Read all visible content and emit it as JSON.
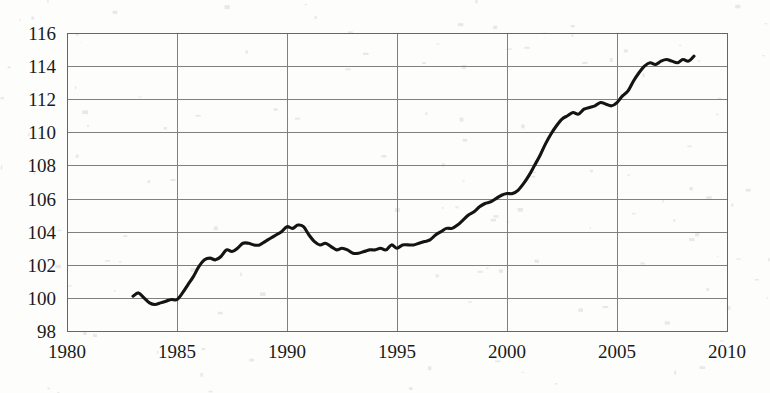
{
  "chart_data": {
    "type": "line",
    "title": "",
    "subtitle": "",
    "xlabel": "",
    "ylabel": "",
    "xlim": [
      1980,
      2010
    ],
    "ylim": [
      98,
      116
    ],
    "grid": true,
    "legend": null,
    "x_ticks": [
      "1980",
      "1985",
      "1990",
      "1995",
      "2000",
      "2005",
      "2010"
    ],
    "y_ticks": [
      "98",
      "100",
      "102",
      "104",
      "106",
      "108",
      "110",
      "112",
      "114",
      "116"
    ],
    "x_tick_values": [
      1980,
      1985,
      1990,
      1995,
      2000,
      2005,
      2010
    ],
    "y_tick_values": [
      98,
      100,
      102,
      104,
      106,
      108,
      110,
      112,
      114,
      116
    ],
    "line_color": "#141414",
    "grid_color": "#808080",
    "background_color": "#fdfdfc",
    "series": [
      {
        "name": "index",
        "x": [
          1983.0,
          1983.25,
          1983.5,
          1983.75,
          1984.0,
          1984.25,
          1984.5,
          1984.75,
          1985.0,
          1985.25,
          1985.5,
          1985.75,
          1986.0,
          1986.25,
          1986.5,
          1986.75,
          1987.0,
          1987.25,
          1987.5,
          1987.75,
          1988.0,
          1988.25,
          1988.5,
          1988.75,
          1989.0,
          1989.25,
          1989.5,
          1989.75,
          1990.0,
          1990.25,
          1990.5,
          1990.75,
          1991.0,
          1991.25,
          1991.5,
          1991.75,
          1992.0,
          1992.25,
          1992.5,
          1992.75,
          1993.0,
          1993.25,
          1993.5,
          1993.75,
          1994.0,
          1994.25,
          1994.5,
          1994.75,
          1995.0,
          1995.25,
          1995.5,
          1995.75,
          1996.0,
          1996.25,
          1996.5,
          1996.75,
          1997.0,
          1997.25,
          1997.5,
          1997.75,
          1998.0,
          1998.25,
          1998.5,
          1998.75,
          1999.0,
          1999.25,
          1999.5,
          1999.75,
          2000.0,
          2000.25,
          2000.5,
          2000.75,
          2001.0,
          2001.25,
          2001.5,
          2001.75,
          2002.0,
          2002.25,
          2002.5,
          2002.75,
          2003.0,
          2003.25,
          2003.5,
          2003.75,
          2004.0,
          2004.25,
          2004.5,
          2004.75,
          2005.0,
          2005.25,
          2005.5,
          2005.75,
          2006.0,
          2006.25,
          2006.5,
          2006.75,
          2007.0,
          2007.25,
          2007.5,
          2007.75,
          2008.0,
          2008.25,
          2008.5
        ],
        "values": [
          100.1,
          100.3,
          100.0,
          99.7,
          99.6,
          99.7,
          99.8,
          99.9,
          99.9,
          100.3,
          100.8,
          101.3,
          101.9,
          102.3,
          102.4,
          102.3,
          102.5,
          102.9,
          102.8,
          103.0,
          103.3,
          103.3,
          103.2,
          103.2,
          103.4,
          103.6,
          103.8,
          104.0,
          104.3,
          104.2,
          104.4,
          104.3,
          103.8,
          103.4,
          103.2,
          103.3,
          103.1,
          102.9,
          103.0,
          102.9,
          102.7,
          102.7,
          102.8,
          102.9,
          102.9,
          103.0,
          102.9,
          103.2,
          103.0,
          103.2,
          103.2,
          103.2,
          103.3,
          103.4,
          103.5,
          103.8,
          104.0,
          104.2,
          104.2,
          104.4,
          104.7,
          105.0,
          105.2,
          105.5,
          105.7,
          105.8,
          106.0,
          106.2,
          106.3,
          106.3,
          106.5,
          106.9,
          107.4,
          108.0,
          108.6,
          109.3,
          109.9,
          110.4,
          110.8,
          111.0,
          111.2,
          111.1,
          111.4,
          111.5,
          111.6,
          111.8,
          111.7,
          111.6,
          111.8,
          112.2,
          112.5,
          113.1,
          113.6,
          114.0,
          114.2,
          114.1,
          114.3,
          114.4,
          114.3,
          114.2,
          114.4,
          114.3,
          114.6
        ]
      }
    ]
  },
  "axes": {
    "plot_left_px": 67,
    "plot_right_px": 727,
    "plot_top_px": 33,
    "plot_bottom_px": 331
  }
}
